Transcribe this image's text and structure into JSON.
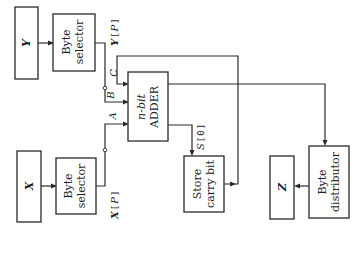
{
  "diagram": {
    "orientation": "rotated 90 degrees counter-clockwise",
    "blocks": {
      "y_input": {
        "label": "Y"
      },
      "y_selector": {
        "line1": "Byte",
        "line2": "selector"
      },
      "x_input": {
        "label": "X"
      },
      "x_selector": {
        "line1": "Byte",
        "line2": "selector"
      },
      "adder": {
        "line1": "n-bit",
        "line2": "ADDER"
      },
      "store_carry": {
        "line1": "Store",
        "line2": "carry bit"
      },
      "z_output": {
        "label": "Z"
      },
      "distributor": {
        "line1": "Byte",
        "line2": "distributor"
      }
    },
    "signals": {
      "y_p": {
        "var": "Y",
        "bracket_open": "[",
        "index": "P",
        "bracket_close": "]"
      },
      "x_p": {
        "var": "X",
        "bracket_open": "[",
        "index": "P",
        "bracket_close": "]"
      },
      "s_0": {
        "var": "S",
        "bracket_open": "[",
        "index": "0",
        "bracket_close": "]"
      },
      "a": "A",
      "b": "B",
      "c": "C"
    },
    "colors": {
      "line": "#2a2a2a",
      "background": "#ffffff"
    }
  }
}
